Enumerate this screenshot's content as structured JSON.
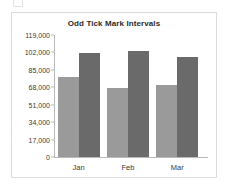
{
  "chart_data": {
    "type": "bar",
    "title": "Odd Tick Mark Intervals",
    "xlabel": "",
    "ylabel": "",
    "categories": [
      "Jan",
      "Feb",
      "Mar"
    ],
    "series": [
      {
        "name": "Series 1",
        "values": [
          78000,
          67500,
          70000
        ],
        "color": "#9a9a9a"
      },
      {
        "name": "Series 2",
        "values": [
          101500,
          103500,
          98000
        ],
        "color": "#6a6a6a"
      }
    ],
    "ylim": [
      0,
      119000
    ],
    "ytick_interval": 17000,
    "yticks": [
      0,
      17000,
      34000,
      51000,
      68000,
      85000,
      102000,
      119000
    ],
    "ytick_labels": [
      "0",
      "17,000",
      "34,000",
      "51,000",
      "68,000",
      "85,000",
      "102,000",
      "119,000"
    ],
    "grid": false,
    "legend": "none",
    "plot_background": "#ffffff",
    "frame_border_color": "#dcdcdc",
    "axis_color": "#b9b9b9"
  }
}
